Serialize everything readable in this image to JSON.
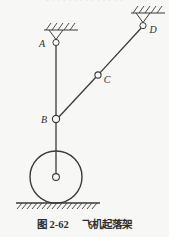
{
  "figure": {
    "truncated_header_text": "· · · · · · · · · · · · · ·",
    "caption_number": "图 2-62",
    "caption_title": "飞机起落架",
    "labels": {
      "a": "A",
      "b": "B",
      "c": "C",
      "d": "D"
    },
    "colors": {
      "background": "#f7f7f5",
      "line": "#3a3a3a",
      "label": "#2f2f2f",
      "caption": "#2d2d2d"
    },
    "elements": {
      "support_a": "fixed-pin-support-hatched",
      "support_d": "fixed-pin-support-hatched",
      "joint_b": "pin-joint",
      "joint_c": "pin-joint",
      "wheel": "landing-gear-wheel",
      "hub": "wheel-hub",
      "ground": "ground-hatching",
      "strut_ab": "vertical-strut",
      "strut_b_hub": "axle-strut",
      "bar_bd": "diagonal-bar"
    },
    "geometry": {
      "a": [
        56,
        43
      ],
      "b": [
        56,
        119
      ],
      "c": [
        98,
        75
      ],
      "d": [
        143,
        26
      ],
      "hub": [
        56,
        177
      ],
      "wheel_radius": 26,
      "ground_y": 203
    }
  }
}
